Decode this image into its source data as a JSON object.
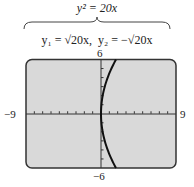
{
  "header": {
    "main_equation": "y² = 20x",
    "y1_label": "y₁ = √20x,",
    "y2_label": "y₂ = −√20x"
  },
  "window": {
    "xmin_label": "−9",
    "xmax_label": "9",
    "ymin_label": "−6",
    "ymax_label": "6"
  },
  "colors": {
    "screen_bg": "#d9d9d9",
    "frame": "#333333",
    "curve": "#111111"
  },
  "chart_data": {
    "type": "line",
    "title": "y² = 20x",
    "series": [
      {
        "name": "y1 = sqrt(20x)",
        "x": [
          0,
          0.2,
          0.45,
          0.8,
          1.25,
          1.8
        ],
        "y": [
          0,
          2,
          3,
          4,
          5,
          6
        ]
      },
      {
        "name": "y2 = -sqrt(20x)",
        "x": [
          0,
          0.2,
          0.45,
          0.8,
          1.25,
          1.8
        ],
        "y": [
          0,
          -2,
          -3,
          -4,
          -5,
          -6
        ]
      }
    ],
    "xlim": [
      -9,
      9
    ],
    "ylim": [
      -6,
      6
    ],
    "xscale": 1,
    "yscale": 1,
    "grid": false,
    "xlabel": "",
    "ylabel": ""
  }
}
